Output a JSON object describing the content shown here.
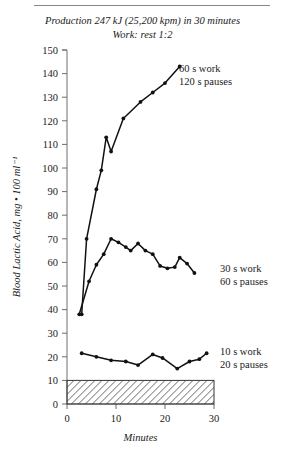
{
  "figure": {
    "title_line1": "Production 247 kJ (25,200 kpm) in 30 minutes",
    "title_line2": "Work: rest 1:2"
  },
  "chart_data": {
    "type": "line",
    "title": "Production 247 kJ (25,200 kpm) in 30 minutes",
    "subtitle": "Work: rest 1:2",
    "xlabel": "Minutes",
    "ylabel": "Blood Lactic Acid, mg • 100 ml⁻¹",
    "xlim": [
      0,
      30
    ],
    "ylim": [
      0,
      150
    ],
    "xticks": [
      0,
      10,
      20,
      30
    ],
    "yticks": [
      0,
      10,
      20,
      30,
      40,
      50,
      60,
      70,
      80,
      90,
      100,
      110,
      120,
      130,
      140,
      150
    ],
    "grid": false,
    "legend_position": "inline-right",
    "series": [
      {
        "name": "60 s work 120 s pauses",
        "label_line1": "60 s work",
        "label_line2": "120 s pauses",
        "color": "#111111",
        "points": [
          [
            3.0,
            38.0
          ],
          [
            4.0,
            70.0
          ],
          [
            6.0,
            91.0
          ],
          [
            7.0,
            99.0
          ],
          [
            8.0,
            113.0
          ],
          [
            9.0,
            107.0
          ],
          [
            11.5,
            121.0
          ],
          [
            15.0,
            128.0
          ],
          [
            17.5,
            132.0
          ],
          [
            20.0,
            136.0
          ],
          [
            23.0,
            143.0
          ]
        ]
      },
      {
        "name": "30 s work 60 s pauses",
        "label_line1": "30 s work",
        "label_line2": "60 s pauses",
        "color": "#111111",
        "points": [
          [
            2.5,
            38.0
          ],
          [
            4.5,
            52.0
          ],
          [
            6.0,
            59.0
          ],
          [
            7.5,
            63.5
          ],
          [
            9.0,
            70.0
          ],
          [
            10.5,
            68.5
          ],
          [
            12.0,
            66.5
          ],
          [
            13.0,
            65.0
          ],
          [
            14.5,
            68.0
          ],
          [
            16.0,
            65.0
          ],
          [
            17.5,
            63.5
          ],
          [
            19.0,
            58.5
          ],
          [
            20.5,
            57.5
          ],
          [
            22.0,
            58.0
          ],
          [
            23.0,
            62.0
          ],
          [
            24.5,
            59.5
          ],
          [
            26.0,
            55.5
          ]
        ]
      },
      {
        "name": "10 s work 20 s pauses",
        "label_line1": "10 s work",
        "label_line2": "20 s pauses",
        "color": "#111111",
        "points": [
          [
            3.0,
            21.5
          ],
          [
            6.0,
            20.0
          ],
          [
            9.0,
            18.5
          ],
          [
            12.0,
            18.0
          ],
          [
            14.5,
            16.5
          ],
          [
            17.5,
            21.0
          ],
          [
            19.5,
            19.5
          ],
          [
            22.5,
            15.0
          ],
          [
            25.0,
            18.0
          ],
          [
            27.0,
            19.0
          ],
          [
            28.5,
            21.5
          ]
        ]
      }
    ],
    "shaded_band": {
      "name": "resting-range-band",
      "y_from": 0,
      "y_to": 10,
      "x_from": 0,
      "x_to": 30,
      "pattern": "diagonal-hatch"
    }
  }
}
